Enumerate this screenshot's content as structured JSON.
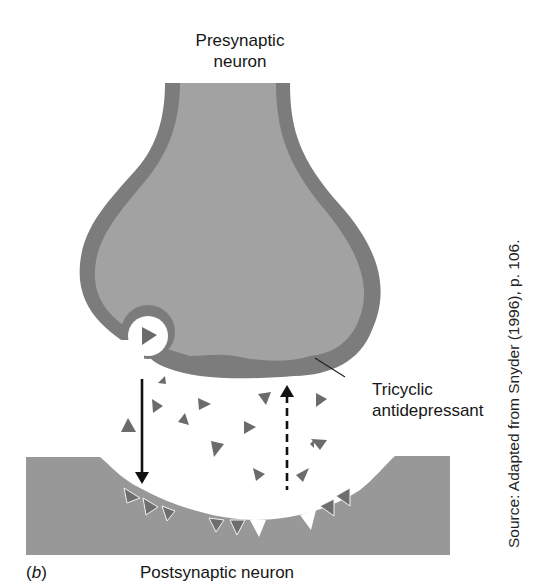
{
  "figure": {
    "panel_label_open": "(",
    "panel_letter": "b",
    "panel_label_close": ")",
    "labels": {
      "presynaptic_line1": "Presynaptic",
      "presynaptic_line2": "neuron",
      "tricyclic_line1": "Tricyclic",
      "tricyclic_line2": "antidepressant",
      "postsynaptic": "Postsynaptic neuron"
    },
    "source": "Source: Adapted from Snyder (1996), p. 106."
  },
  "colors": {
    "neuron_fill": "#9e9e9e",
    "membrane": "#7a7a7a",
    "postsynaptic_fill": "#959595",
    "neurotransmitter": "#6b6b6b",
    "arrow": "#111111",
    "background": "#ffffff"
  },
  "elements": {
    "vesicle": "synaptic-vesicle-releasing",
    "release_arrow": "solid-arrow-down",
    "reuptake_arrow": "dashed-arrow-up-blocked",
    "neurotransmitter_count_cleft": 14,
    "receptor_count": 11
  }
}
